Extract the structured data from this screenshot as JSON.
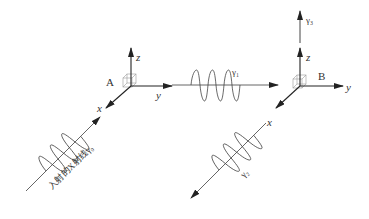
{
  "diagram": {
    "title": "",
    "point_a": {
      "label": "A"
    },
    "point_b": {
      "label": "B"
    },
    "axes": {
      "x": "x",
      "y": "y",
      "z": "z"
    },
    "incident_ray": {
      "label": "入射的X射线γ₀"
    },
    "gamma1": {
      "label": "γ₁"
    },
    "gamma2": {
      "label": "γ₂"
    },
    "gamma3": {
      "label": "γ₃"
    },
    "colors": {
      "line": "#444444",
      "arrow": "#222222",
      "cube": "#999999",
      "text": "#333333"
    }
  }
}
